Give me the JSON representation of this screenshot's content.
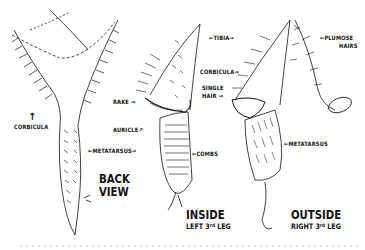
{
  "figure": {
    "views": [
      {
        "id": "back",
        "title_line1": "BACK",
        "title_line2": "VIEW"
      },
      {
        "id": "inside",
        "title": "INSIDE",
        "subtitle_pre": "LEFT 3",
        "subtitle_sup": "rd",
        "subtitle_post": " LEG"
      },
      {
        "id": "outside",
        "title": "OUTSIDE",
        "subtitle_pre": "RIGHT 3",
        "subtitle_sup": "rd",
        "subtitle_post": " LEG"
      }
    ],
    "labels": {
      "corbicula_back": "CORBICULA",
      "metatarsus_mid": "METATARSUS",
      "rake": "RAKE",
      "auricle": "AURICLE",
      "combs": "COMBS",
      "tibia": "TIBIA",
      "corbicula_outside": "CORBICULA",
      "single_hair_1": "SINGLE",
      "single_hair_2": "HAIR",
      "plumose_1": "PLUMOSE",
      "plumose_2": "HAIRS",
      "metatarsus_outside": "METATARSUS"
    },
    "arrows": {
      "left": "←",
      "right": "→",
      "up": "↑",
      "upright": "↗"
    },
    "colors": {
      "ink": "#111111",
      "background": "#ffffff"
    }
  }
}
